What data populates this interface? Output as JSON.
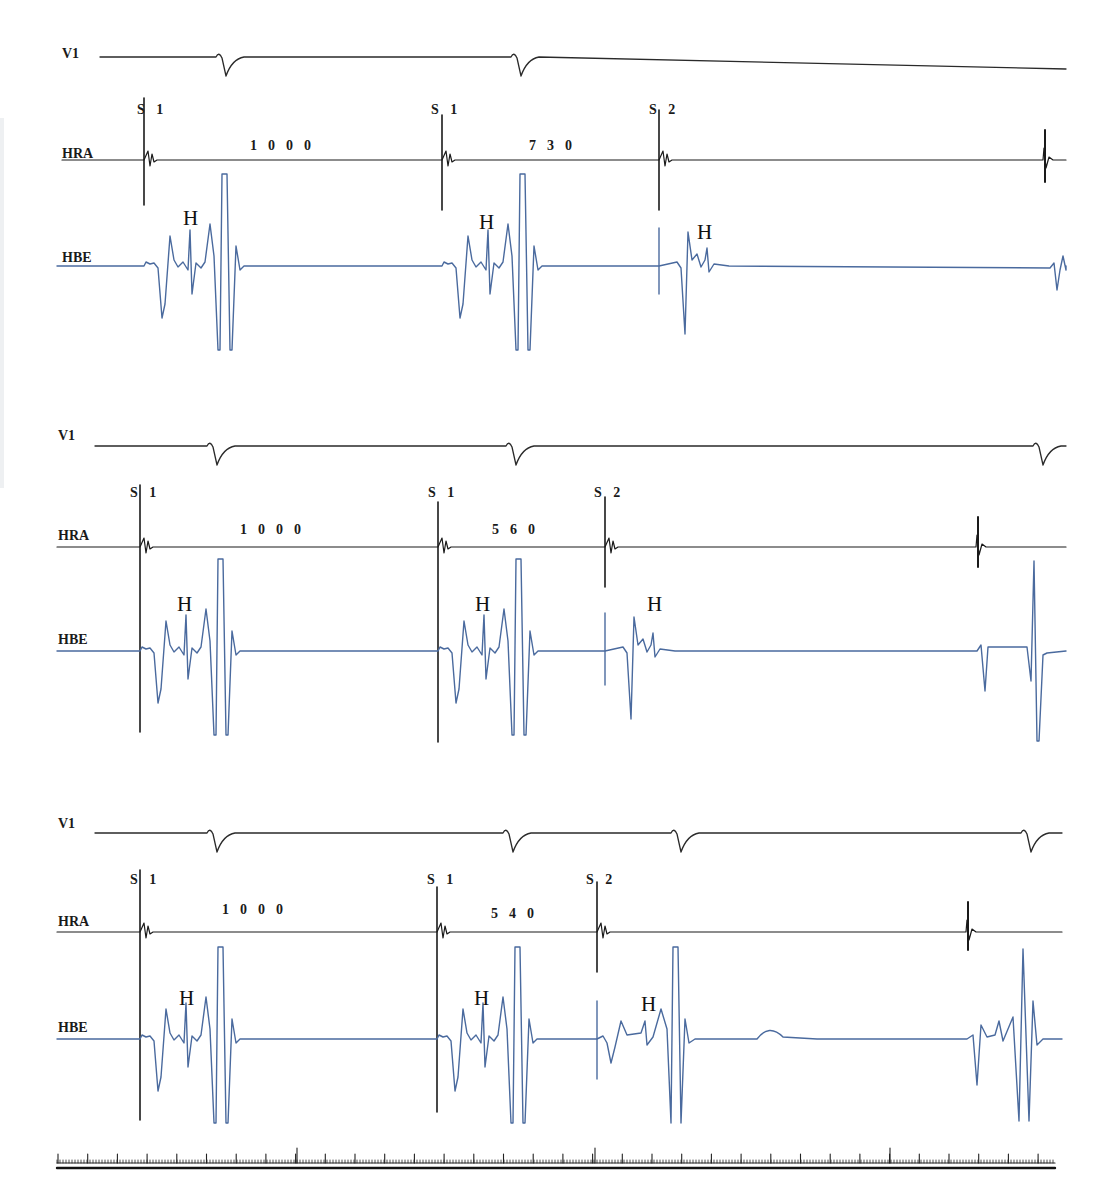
{
  "chart_data": {
    "type": "line",
    "title": "",
    "leads": [
      "V1",
      "HRA",
      "HBE"
    ],
    "lead_colors": {
      "V1": "#2a2a2a",
      "HRA": "#1a1a1a",
      "HBE": "#4a6a9e"
    },
    "panels": [
      {
        "id": 1,
        "basic_cycle_length_ms": 1000,
        "coupling_interval_ms": 730,
        "labels": {
          "v1": "V1",
          "hra": "HRA",
          "hbe": "HBE",
          "s1a": "S 1",
          "s1b": "S 1",
          "s2": "S 2",
          "interval1": "1000",
          "interval2": "730",
          "h1": "H",
          "h2": "H",
          "h3": "H"
        },
        "baselines_y": {
          "v1": 57,
          "hra": 160,
          "hbe": 266
        },
        "stimuli_x": {
          "s1a": 144,
          "s1b": 442,
          "s2": 659,
          "spontaneous": 1044
        },
        "v1_qrs_x": [
          222,
          517
        ],
        "hbe_his_x": [
          191,
          487,
          707
        ],
        "conduction": "S2 conducted with H but without following QRS (block below His)"
      },
      {
        "id": 2,
        "basic_cycle_length_ms": 1000,
        "coupling_interval_ms": 560,
        "labels": {
          "v1": "V1",
          "hra": "HRA",
          "hbe": "HBE",
          "s1a": "S 1",
          "s1b": "S 1",
          "s2": "S 2",
          "interval1": "1000",
          "interval2": "560",
          "h1": "H",
          "h2": "H",
          "h3": "H"
        },
        "baselines_y": {
          "v1": 446,
          "hra": 547,
          "hbe": 651
        },
        "stimuli_x": {
          "s1a": 140,
          "s1b": 438,
          "s2": 605,
          "spontaneous": 977
        },
        "v1_qrs_x": [
          213,
          512,
          1039
        ],
        "hbe_his_x": [
          187,
          484,
          656
        ],
        "conduction": "S2 conducted with H but without following QRS (infra-His block)"
      },
      {
        "id": 3,
        "basic_cycle_length_ms": 1000,
        "coupling_interval_ms": 540,
        "labels": {
          "v1": "V1",
          "hra": "HRA",
          "hbe": "HBE",
          "s1a": "S 1",
          "s1b": "S 1",
          "s2": "S 2",
          "interval1": "1000",
          "interval2": "540",
          "h1": "H",
          "h2": "H",
          "h3": "H"
        },
        "baselines_y": {
          "v1": 833,
          "hra": 932,
          "hbe": 1039
        },
        "stimuli_x": {
          "s1a": 140,
          "s1b": 437,
          "s2": 597,
          "spontaneous": 967
        },
        "v1_qrs_x": [
          213,
          509,
          677,
          1027
        ],
        "hbe_his_x": [
          187,
          484,
          652
        ],
        "conduction": "S2 conducted with H followed by QRS"
      }
    ],
    "time_scale": {
      "minor_tick_px": 3,
      "major_tick_every_px": 29.7,
      "long_tick_x": [
        297,
        595,
        890
      ],
      "x_range_px": [
        57,
        1055
      ]
    },
    "axes": {
      "grid": false,
      "legend": "none"
    }
  },
  "caption": {
    "visible_text": "",
    "color": "#2f5fa7",
    "note": "caption text truncated at bottom edge"
  }
}
